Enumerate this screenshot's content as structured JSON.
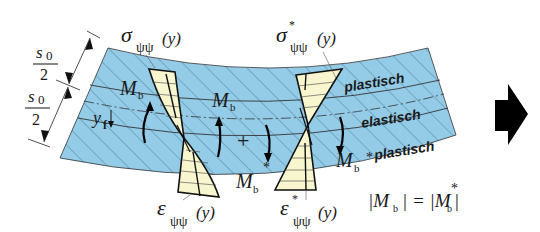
{
  "figure": {
    "colors": {
      "background": "#ffffff",
      "plate_fill": "#94cce8",
      "hatch": "#3a6d8a",
      "stress_fill": "#f7f6cf",
      "outline": "#111111",
      "arrow": "#000000"
    },
    "dimension": {
      "upper_label_num": "s",
      "upper_label_sub": "0",
      "upper_label_den": "2",
      "lower_label_num": "s",
      "lower_label_sub": "0",
      "lower_label_den": "2"
    },
    "labels": {
      "sigma_left": "σ",
      "sigma_left_sub": "ψψ",
      "sigma_left_arg": "(y)",
      "sigma_right": "σ",
      "sigma_right_star": "*",
      "sigma_right_sub": "ψψ",
      "sigma_right_arg": "(y)",
      "eps_left": "ε",
      "eps_left_sub": "ψψ",
      "eps_left_arg": "(y)",
      "eps_right": "ε",
      "eps_right_star": "*",
      "eps_right_sub": "ψψ",
      "eps_right_arg": "(y)",
      "y_f": "y",
      "y_f_sub": "f",
      "moment_left_upper": "M",
      "moment_left_upper_sub": "b",
      "moment_mid_upper": "M",
      "moment_mid_upper_sub": "b",
      "moment_mid_lower": "M",
      "moment_mid_lower_sub": "b",
      "moment_mid_lower_star": "*",
      "moment_right_lower": "M",
      "moment_right_lower_sub": "b",
      "moment_right_lower_star": "*",
      "plus": "+",
      "zone_top": "plastisch",
      "zone_mid": "elastisch",
      "zone_bottom": "plastisch",
      "equation_lhs": "|M",
      "equation_lhs_sub": "b",
      "equation_eq": "| = |M",
      "equation_rhs_sub": "b",
      "equation_rhs_star": "*",
      "equation_close": "|"
    },
    "next_arrow_icon": "arrow-right-icon"
  }
}
